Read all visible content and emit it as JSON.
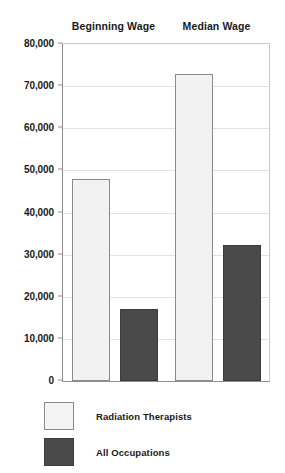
{
  "chart_data": {
    "type": "bar",
    "title": "",
    "xlabel": "",
    "ylabel": "",
    "categories": [
      "Beginning Wage",
      "Median Wage"
    ],
    "series": [
      {
        "name": "Radiation Therapists",
        "color": "#f2f2f2",
        "values": [
          48000,
          72800
        ]
      },
      {
        "name": "All Occupations",
        "color": "#4a4a4a",
        "values": [
          17000,
          32300
        ]
      }
    ],
    "ylim": [
      0,
      80000
    ],
    "ytick_step": 10000,
    "ytick_labels": [
      "80,000",
      "70,000",
      "60,000",
      "50,000",
      "40,000",
      "30,000",
      "20,000",
      "10,000",
      "0"
    ],
    "ytick_values": [
      80000,
      70000,
      60000,
      50000,
      40000,
      30000,
      20000,
      10000,
      0
    ],
    "grid": true,
    "legend_position": "bottom-left"
  },
  "headers": [
    {
      "label": "Beginning Wage"
    },
    {
      "label": "Median Wage"
    }
  ],
  "legend": {
    "items": [
      {
        "label": "Radiation Therapists",
        "swatch": "light"
      },
      {
        "label": "All Occupations",
        "swatch": "dark"
      }
    ]
  },
  "colors": {
    "series_light": "#f2f2f2",
    "series_dark": "#4a4a4a",
    "axis": "#8f8f8f",
    "gridline": "#e2e2e2",
    "text": "#1a1a1a",
    "background": "#ffffff"
  }
}
